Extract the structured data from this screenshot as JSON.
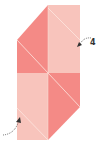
{
  "diagram": {
    "type": "origami-fold-step",
    "colors": {
      "dark_pink": "#f48a86",
      "light_pink": "#f8c4bc",
      "crease": "#fde6e0",
      "arrow": "#333333"
    },
    "labels": {
      "step_number": "4"
    },
    "arrows": [
      {
        "name": "fold-arrow-top-right",
        "direction": "into-shape"
      },
      {
        "name": "fold-arrow-bottom-left",
        "direction": "into-shape"
      }
    ]
  }
}
